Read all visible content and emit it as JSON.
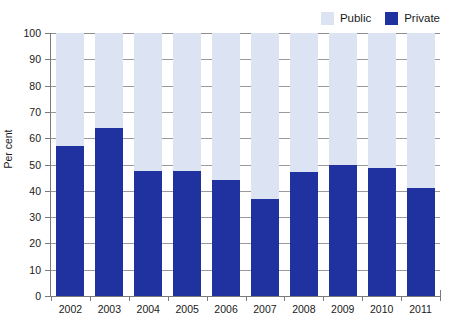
{
  "chart_data": {
    "type": "bar",
    "subtype": "stacked-100-percent",
    "title": "",
    "subtitle": "",
    "xlabel": "",
    "ylabel": "Per cent",
    "categories": [
      "2002",
      "2003",
      "2004",
      "2005",
      "2006",
      "2007",
      "2008",
      "2009",
      "2010",
      "2011"
    ],
    "series": [
      {
        "name": "Private",
        "color": "#1f32a0",
        "values": [
          57,
          64,
          47.5,
          47.5,
          44,
          37,
          47,
          50,
          48.5,
          41
        ]
      },
      {
        "name": "Public",
        "color": "#dce3f2",
        "values": [
          43,
          36,
          52.5,
          52.5,
          56,
          63,
          53,
          50,
          51.5,
          59
        ]
      }
    ],
    "ylim": [
      0,
      100
    ],
    "ytick_labels": [
      "100",
      "90",
      "80",
      "70",
      "60",
      "50",
      "40",
      "30",
      "20",
      "10",
      "0"
    ],
    "ytick_values": [
      100,
      90,
      80,
      70,
      60,
      50,
      40,
      30,
      20,
      10,
      0
    ],
    "grid": true,
    "grid_axis": "y",
    "legend_position": "top-right",
    "legend": [
      {
        "label": "Public",
        "color": "#dce3f2"
      },
      {
        "label": "Private",
        "color": "#1f32a0"
      }
    ]
  }
}
